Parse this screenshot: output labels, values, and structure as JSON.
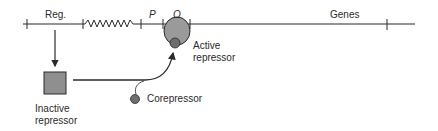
{
  "labels": {
    "regulator": "Reg.",
    "promoter": "P",
    "operator": "O",
    "genes": "Genes",
    "active_repressor_line1": "Active",
    "active_repressor_line2": "repressor",
    "inactive_repressor_line1": "Inactive",
    "inactive_repressor_line2": "repressor",
    "corepressor": "Corepressor"
  },
  "colors": {
    "line": "#2a2a2a",
    "repressor_fill": "#9a9a9a",
    "corepressor_fill": "#6e6e6e",
    "background": "#ffffff"
  }
}
